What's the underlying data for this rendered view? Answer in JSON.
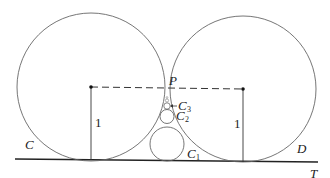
{
  "diagram": {
    "labels": {
      "C": "C",
      "D": "D",
      "P": "P",
      "T": "T",
      "C1": "C",
      "C1_sub": "1",
      "C2": "C",
      "C2_sub": "2",
      "C3": "C",
      "C3_sub": "3",
      "radius_left": "1",
      "radius_right": "1"
    },
    "elements": {
      "large_circles": [
        "C",
        "D"
      ],
      "small_circles": [
        "C1",
        "C2",
        "C3"
      ],
      "tangent_line": "T",
      "tangent_point": "P",
      "center_connector": "dashed line between centers",
      "radii": "vertical radii of length 1 from each center to line T"
    },
    "colors": {
      "stroke": "#555555",
      "line": "#222222",
      "background": "#ffffff"
    }
  }
}
